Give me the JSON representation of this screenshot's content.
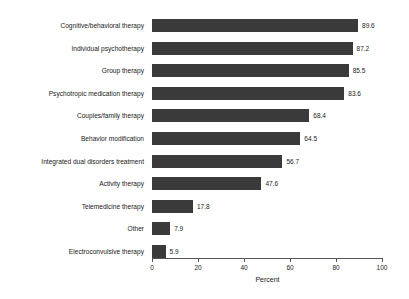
{
  "chart_data": {
    "type": "bar",
    "orientation": "horizontal",
    "title": "",
    "xlabel": "Percent",
    "ylabel": "",
    "xlim": [
      0,
      100
    ],
    "xticks": [
      0,
      20,
      40,
      60,
      80,
      100
    ],
    "grid": false,
    "legend": null,
    "bar_color": "#3a3a3a",
    "categories": [
      "Cognitive/behavioral therapy",
      "Individual psychotherapy",
      "Group therapy",
      "Psychotropic medication therapy",
      "Couples/family therapy",
      "Behavior modification",
      "Integrated dual disorders treatment",
      "Activity therapy",
      "Telemedicine therapy",
      "Other",
      "Electroconvulsive therapy"
    ],
    "values": [
      89.6,
      87.2,
      85.5,
      83.6,
      68.4,
      64.5,
      56.7,
      47.6,
      17.8,
      7.9,
      5.9
    ],
    "value_labels": [
      "89.6",
      "87.2",
      "85.5",
      "83.6",
      "68.4",
      "64.5",
      "56.7",
      "47.6",
      "17.8",
      "7.9",
      "5.9"
    ],
    "xtick_labels": [
      "0",
      "20",
      "40",
      "60",
      "80",
      "100"
    ]
  }
}
